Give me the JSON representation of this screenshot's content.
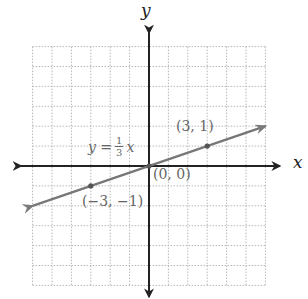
{
  "chart_data": {
    "type": "line",
    "title": "",
    "xlabel": "x",
    "ylabel": "y",
    "xlim": [
      -6,
      6
    ],
    "ylim": [
      -6,
      6
    ],
    "grid": true,
    "grid_style": "dotted",
    "series": [
      {
        "name": "y = 1/3 x",
        "equation": "y = (1/3)x",
        "slope": 0.3333,
        "intercept": 0,
        "x": [
          -6,
          -3,
          0,
          3,
          6
        ],
        "y": [
          -2,
          -1,
          0,
          1,
          2
        ],
        "color": "#777777"
      }
    ],
    "points": [
      {
        "x": 3,
        "y": 1,
        "label": "(3, 1)"
      },
      {
        "x": 0,
        "y": 0,
        "label": "(0, 0)"
      },
      {
        "x": -3,
        "y": -1,
        "label": "(−3, −1)"
      }
    ],
    "annotations": [
      {
        "text": "y = 1/3 x",
        "position": "above line, left of y-axis"
      }
    ]
  },
  "labels": {
    "x_axis": "x",
    "y_axis": "y",
    "eq_lhs": "y =",
    "eq_num": "1",
    "eq_den": "3",
    "eq_var": "x",
    "pt1": "(3, 1)",
    "pt2": "(0, 0)",
    "pt3": "(−3, −1)"
  },
  "colors": {
    "axis": "#222222",
    "line": "#7a7a7a",
    "grid": "#b8b8b8",
    "label": "#666666"
  }
}
